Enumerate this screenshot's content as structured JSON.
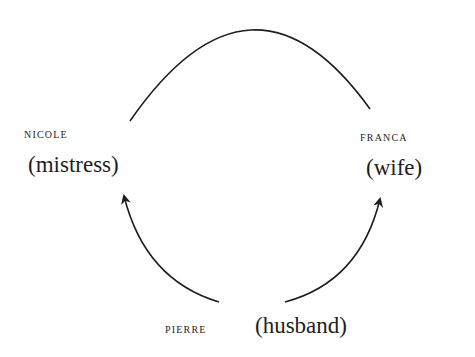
{
  "diagram": {
    "type": "relationship-cycle",
    "nodes": [
      {
        "id": "nicole",
        "name": "NICOLE",
        "role": "(mistress)"
      },
      {
        "id": "franca",
        "name": "FRANCA",
        "role": "(wife)"
      },
      {
        "id": "pierre",
        "name": "PIERRE",
        "role": "(husband)"
      }
    ],
    "edges": [
      {
        "from": "nicole",
        "to": "franca",
        "style": "plain-arc"
      },
      {
        "from": "pierre",
        "to": "nicole",
        "style": "arrow"
      },
      {
        "from": "pierre",
        "to": "franca",
        "style": "arrow"
      }
    ],
    "colors": {
      "ink": "#1e1e1e",
      "background": "#ffffff"
    }
  }
}
